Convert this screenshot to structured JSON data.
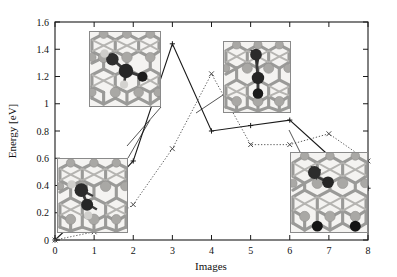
{
  "figure": {
    "title": "",
    "caption": ""
  },
  "chart_data": {
    "type": "line",
    "title": "",
    "xlabel": "Images",
    "ylabel": "Energy [eV]",
    "xlim": [
      0,
      8
    ],
    "ylim": [
      0,
      1.6
    ],
    "xticks": [
      0,
      1,
      2,
      3,
      4,
      5,
      6,
      7,
      8
    ],
    "xticklabels": [
      "0",
      "1",
      "2",
      "3",
      "4",
      "5",
      "6",
      "7",
      "8"
    ],
    "yticks": [
      0,
      0.2,
      0.4,
      0.6,
      0.8,
      1.0,
      1.2,
      1.4,
      1.6
    ],
    "yticklabels": [
      "0",
      "0.2",
      "0.4",
      "0.6",
      "0.8",
      "1",
      "1.2",
      "1.4",
      "1.6"
    ],
    "grid": false,
    "legend": "none",
    "series": [
      {
        "name": "path-solid",
        "style": "solid",
        "marker": "plus",
        "color": "#1a1a1a",
        "x": [
          0,
          1,
          2,
          3,
          4,
          5,
          6,
          7,
          8
        ],
        "values": [
          0.0,
          0.27,
          0.58,
          1.44,
          0.8,
          0.84,
          0.88,
          0.62,
          0.38
        ]
      },
      {
        "name": "path-dotted",
        "style": "dotted",
        "marker": "cross",
        "color": "#4a4a4a",
        "x": [
          0,
          1,
          2,
          3,
          4,
          5,
          6,
          7,
          8
        ],
        "values": [
          0.0,
          0.06,
          0.26,
          0.67,
          1.22,
          0.7,
          0.7,
          0.78,
          0.58
        ]
      }
    ]
  },
  "insets": [
    {
      "name": "structure-top-left",
      "description": "zeolite framework with adsorbed molecule",
      "x": 89,
      "y": 31,
      "w": 72,
      "h": 76,
      "leader_from": [
        161,
        107
      ],
      "leader_to": [
        127,
        146
      ]
    },
    {
      "name": "structure-bottom-left",
      "description": "zeolite framework with adsorbed molecule",
      "x": 57,
      "y": 158,
      "w": 71,
      "h": 75,
      "leader_from": [
        128,
        158
      ],
      "leader_to": [
        150,
        120
      ]
    },
    {
      "name": "structure-top-right",
      "description": "zeolite framework with adsorbed molecule",
      "x": 223,
      "y": 41,
      "w": 68,
      "h": 72,
      "leader_from": [
        223,
        95
      ],
      "leader_to": [
        196,
        113
      ]
    },
    {
      "name": "structure-bottom-right",
      "description": "zeolite framework with two dark adsorbate atoms",
      "x": 290,
      "y": 152,
      "w": 78,
      "h": 81,
      "leader_from": [
        300,
        152
      ],
      "leader_to": [
        289,
        130
      ]
    }
  ],
  "axes": {
    "x_axis_name": "Images",
    "y_axis_name": "Energy [eV]"
  }
}
